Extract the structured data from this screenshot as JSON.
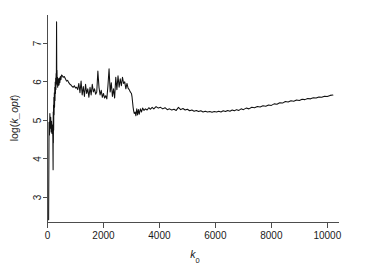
{
  "chart_data": {
    "type": "line",
    "title": "",
    "subtitle": "",
    "xlabel": "k0",
    "xlabel_base": "k",
    "xlabel_sub": "0",
    "ylabel": "log(k_opt)",
    "ylabel_prefix": "log(",
    "ylabel_italic": "k_opt",
    "ylabel_suffix": ")",
    "xlim": [
      0,
      10400
    ],
    "ylim": [
      2.35,
      7.75
    ],
    "xticks": [
      0,
      2000,
      4000,
      6000,
      8000,
      10000
    ],
    "xtick_labels": [
      "0",
      "2000",
      "4000",
      "6000",
      "8000",
      "10000"
    ],
    "yticks": [
      3,
      4,
      5,
      6,
      7
    ],
    "ytick_labels": [
      "3",
      "4",
      "5",
      "6",
      "7"
    ],
    "grid": false,
    "legend": null,
    "line_color": "#111111",
    "axis_color": "#4d4d4d",
    "background": "#ffffff",
    "box": "L-shaped axes (left and bottom spines)",
    "annotations": [],
    "series": [
      {
        "name": "log(k_opt)",
        "x": [
          40,
          55,
          70,
          85,
          100,
          115,
          130,
          145,
          160,
          175,
          190,
          200,
          205,
          210,
          215,
          220,
          228,
          236,
          244,
          252,
          260,
          268,
          276,
          284,
          292,
          300,
          308,
          316,
          324,
          332,
          340,
          348,
          356,
          364,
          372,
          380,
          388,
          396,
          404,
          412,
          420,
          440,
          460,
          480,
          500,
          530,
          560,
          600,
          640,
          680,
          720,
          760,
          800,
          840,
          880,
          920,
          960,
          1000,
          1040,
          1080,
          1120,
          1160,
          1200,
          1240,
          1280,
          1320,
          1360,
          1400,
          1440,
          1480,
          1520,
          1560,
          1600,
          1640,
          1680,
          1720,
          1760,
          1800,
          1840,
          1880,
          1920,
          1960,
          2000,
          2040,
          2080,
          2120,
          2160,
          2200,
          2240,
          2280,
          2320,
          2360,
          2400,
          2440,
          2480,
          2520,
          2560,
          2600,
          2640,
          2680,
          2720,
          2760,
          2800,
          2840,
          2880,
          2920,
          2960,
          2980,
          3000,
          3020,
          3040,
          3060,
          3080,
          3100,
          3130,
          3160,
          3190,
          3220,
          3250,
          3280,
          3320,
          3360,
          3400,
          3450,
          3500,
          3560,
          3620,
          3680,
          3740,
          3800,
          3880,
          3960,
          4040,
          4120,
          4200,
          4280,
          4360,
          4440,
          4520,
          4600,
          4680,
          4760,
          4840,
          4920,
          5000,
          5080,
          5160,
          5240,
          5320,
          5400,
          5480,
          5560,
          5640,
          5720,
          5800,
          5880,
          5960,
          6040,
          6120,
          6200,
          6280,
          6360,
          6440,
          6520,
          6600,
          6680,
          6760,
          6840,
          6920,
          7000,
          7100,
          7200,
          7300,
          7400,
          7500,
          7600,
          7700,
          7800,
          7900,
          8000,
          8100,
          8200,
          8300,
          8400,
          8500,
          8600,
          8700,
          8800,
          8900,
          9000,
          9100,
          9200,
          9300,
          9400,
          9500,
          9600,
          9700,
          9800,
          9900,
          10000,
          10100,
          10200
        ],
        "y": [
          2.42,
          4.95,
          4.62,
          5.18,
          4.8,
          5.08,
          4.7,
          4.98,
          4.66,
          4.88,
          4.58,
          3.72,
          5.22,
          4.42,
          5.4,
          4.75,
          5.6,
          5.15,
          5.72,
          5.34,
          5.86,
          5.52,
          6.0,
          5.7,
          6.1,
          5.8,
          6.22,
          5.95,
          7.56,
          6.05,
          6.3,
          5.92,
          6.12,
          5.86,
          6.05,
          5.9,
          6.08,
          5.94,
          6.02,
          5.92,
          6.1,
          5.98,
          6.14,
          6.06,
          6.18,
          6.16,
          6.12,
          6.14,
          6.08,
          6.02,
          6.04,
          5.98,
          5.94,
          5.92,
          5.88,
          5.86,
          5.9,
          5.84,
          5.86,
          5.8,
          5.96,
          5.72,
          6.02,
          5.66,
          5.88,
          5.62,
          5.94,
          5.7,
          5.82,
          5.6,
          5.86,
          5.66,
          5.94,
          5.74,
          5.82,
          5.68,
          5.74,
          6.28,
          5.86,
          5.66,
          5.78,
          5.6,
          5.7,
          5.58,
          5.64,
          5.56,
          5.9,
          6.34,
          5.74,
          5.98,
          5.62,
          5.82,
          5.58,
          6.12,
          5.8,
          6.16,
          5.86,
          6.08,
          5.9,
          6.12,
          5.96,
          6.0,
          5.82,
          5.96,
          5.84,
          5.8,
          5.74,
          5.72,
          5.7,
          5.62,
          5.48,
          5.34,
          5.24,
          5.18,
          5.22,
          5.12,
          5.3,
          5.14,
          5.28,
          5.16,
          5.3,
          5.22,
          5.32,
          5.26,
          5.3,
          5.27,
          5.33,
          5.29,
          5.34,
          5.3,
          5.36,
          5.32,
          5.34,
          5.3,
          5.33,
          5.28,
          5.3,
          5.27,
          5.29,
          5.26,
          5.34,
          5.28,
          5.31,
          5.27,
          5.29,
          5.25,
          5.27,
          5.24,
          5.26,
          5.23,
          5.25,
          5.22,
          5.24,
          5.22,
          5.23,
          5.21,
          5.23,
          5.22,
          5.24,
          5.22,
          5.25,
          5.23,
          5.26,
          5.24,
          5.27,
          5.25,
          5.28,
          5.26,
          5.3,
          5.28,
          5.32,
          5.3,
          5.34,
          5.33,
          5.36,
          5.35,
          5.38,
          5.37,
          5.4,
          5.39,
          5.43,
          5.42,
          5.46,
          5.45,
          5.49,
          5.48,
          5.51,
          5.5,
          5.53,
          5.52,
          5.55,
          5.54,
          5.57,
          5.56,
          5.59,
          5.58,
          5.61,
          5.6,
          5.63,
          5.62,
          5.65,
          5.66
        ]
      }
    ]
  }
}
